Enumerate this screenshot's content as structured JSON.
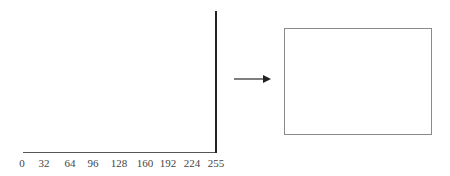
{
  "chart_data": {
    "type": "bar",
    "title": "",
    "xlabel": "",
    "ylabel": "",
    "x_ticks": [
      "0",
      "32",
      "64",
      "96",
      "128",
      "160",
      "192",
      "224",
      "255"
    ],
    "xlim": [
      0,
      255
    ],
    "bars": [
      {
        "x": 255,
        "value": 1.0
      }
    ],
    "grid": false,
    "legend": null
  },
  "histogram": {
    "tick_labels": [
      "0",
      "32",
      "64",
      "96",
      "128",
      "160",
      "192",
      "224",
      "255"
    ],
    "tick_positions_px": [
      22,
      44,
      70,
      93,
      119,
      145,
      168,
      192,
      216
    ],
    "bar": {
      "value_label": "255",
      "x_px": 215,
      "top_px": 11,
      "bottom_px": 153
    }
  },
  "arrow": {
    "direction": "right",
    "color": "#333333"
  },
  "output_image": {
    "fill": "#ffffff",
    "border_color": "#8a8a8a"
  },
  "colors": {
    "axis": "#555555",
    "bar": "#222222",
    "labels": "#444444"
  }
}
